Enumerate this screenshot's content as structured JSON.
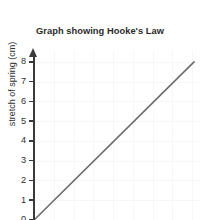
{
  "chart_data": {
    "type": "line",
    "title": "Graph showing Hooke's Law",
    "xlabel": "",
    "ylabel": "stretch of spring (cm)",
    "ylim": [
      0,
      8.6
    ],
    "xlim": [
      0,
      8.4
    ],
    "grid": true,
    "legend": false,
    "y_ticks": [
      {
        "value": 8,
        "label": "8"
      },
      {
        "value": 7,
        "label": "7"
      },
      {
        "value": 6,
        "label": "6"
      },
      {
        "value": 5,
        "label": "5"
      },
      {
        "value": 4,
        "label": "4"
      },
      {
        "value": 3,
        "label": "3"
      },
      {
        "value": 2,
        "label": "2"
      },
      {
        "value": 1,
        "label": "1"
      },
      {
        "value": 0,
        "label": "0"
      }
    ],
    "x_ticks": [],
    "series": [
      {
        "name": "stretch of spring",
        "color": "#6b6b6b",
        "x": [
          0,
          8.1
        ],
        "y": [
          0,
          8.0
        ]
      }
    ]
  },
  "style": {
    "title_color": "#2b2b2b",
    "axis_color": "#3a3a3a",
    "tick_label_color": "#2f2f2f",
    "grid_color": "#f7f7f7",
    "line_color": "#6b6b6b",
    "background": "#ffffff"
  }
}
